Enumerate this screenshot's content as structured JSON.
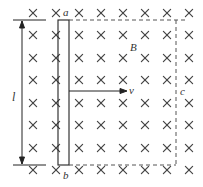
{
  "diagram": {
    "labels": {
      "a": "a",
      "b": "b",
      "B": "B",
      "v": "v",
      "c": "c",
      "I": "l"
    },
    "field_symbol": "×",
    "grid": {
      "columns_x": [
        33,
        56,
        79,
        101,
        123,
        145,
        167,
        189
      ],
      "rows_y": [
        13,
        35,
        58,
        80,
        103,
        125,
        148,
        170
      ]
    },
    "colors": {
      "line": "#222222",
      "cross": "#444444",
      "dashed": "#555555",
      "text": "#333333"
    }
  }
}
